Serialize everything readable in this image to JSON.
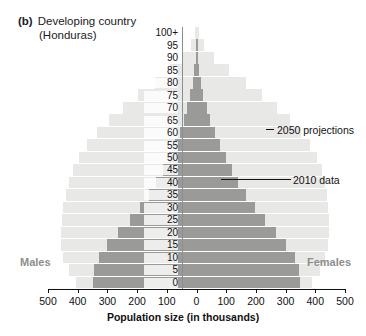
{
  "title": {
    "tag": "(b)",
    "line1": "Developing country",
    "line2": "(Honduras)"
  },
  "labels": {
    "males": "Males",
    "females": "Females",
    "x_axis_title": "Population size (in thousands)"
  },
  "annotations": [
    {
      "id": "proj",
      "text": "2050 projections"
    },
    {
      "id": "data",
      "text": "2010 data"
    }
  ],
  "colors": {
    "projection_bar": "#e8e8e6",
    "data_bar": "#9a9a98",
    "axis": "#111111",
    "side_label": "#8e8e8c"
  },
  "chart_data": {
    "type": "bar",
    "subtype": "population-pyramid",
    "xlabel": "Population size (in thousands)",
    "ylabel": "",
    "xlim": [
      -500,
      500
    ],
    "xticks": [
      -500,
      -400,
      -300,
      -200,
      -100,
      0,
      100,
      200,
      300,
      400,
      500
    ],
    "xticklabels": [
      "500",
      "400",
      "300",
      "200",
      "100",
      "0",
      "100",
      "200",
      "300",
      "400",
      "500"
    ],
    "grid": false,
    "legend_position": "annotations",
    "categories": [
      "0",
      "5",
      "10",
      "15",
      "20",
      "25",
      "30",
      "35",
      "40",
      "45",
      "50",
      "55",
      "60",
      "65",
      "70",
      "75",
      "80",
      "85",
      "90",
      "95",
      "100+"
    ],
    "series": [
      {
        "name": "2010 data",
        "color": "#9a9a98",
        "males": [
          350,
          345,
          330,
          300,
          265,
          225,
          190,
          160,
          135,
          112,
          92,
          73,
          57,
          43,
          31,
          21,
          13,
          7,
          3,
          1,
          0
        ],
        "females": [
          350,
          344,
          330,
          302,
          268,
          230,
          196,
          166,
          141,
          118,
          98,
          79,
          62,
          47,
          34,
          23,
          14,
          8,
          3,
          1,
          0
        ]
      },
      {
        "name": "2050 projections",
        "color": "#e8e8e6",
        "males": [
          405,
          430,
          448,
          455,
          455,
          452,
          448,
          440,
          430,
          415,
          395,
          368,
          335,
          295,
          248,
          196,
          140,
          88,
          45,
          18,
          5
        ],
        "females": [
          390,
          415,
          433,
          442,
          445,
          445,
          443,
          438,
          432,
          422,
          406,
          382,
          352,
          316,
          272,
          222,
          166,
          110,
          60,
          26,
          8
        ]
      }
    ]
  }
}
